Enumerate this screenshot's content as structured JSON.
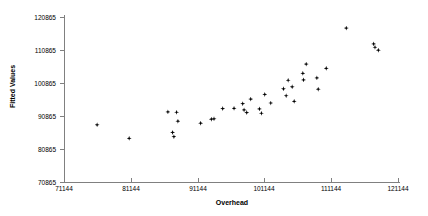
{
  "chart_data": {
    "type": "scatter",
    "title": "",
    "xlabel": "Overhead",
    "ylabel": "Fitted Values",
    "xlim": [
      71144,
      121144
    ],
    "ylim": [
      70865,
      120865
    ],
    "grid": false,
    "legend": null,
    "x_ticks": [
      71144,
      81144,
      91144,
      101144,
      111144,
      121144
    ],
    "y_ticks": [
      70865,
      80865,
      90865,
      100865,
      110865,
      120865
    ],
    "x_tick_labels": [
      "71144",
      "81144",
      "91144",
      "101144",
      "111144",
      "121144"
    ],
    "y_tick_labels": [
      "70865",
      "80865",
      "90865",
      "100865",
      "110865",
      "120865"
    ],
    "series": [
      {
        "name": "Fitted Values vs Overhead",
        "marker": "diamond",
        "color": "#000000",
        "points": [
          [
            76100,
            88200
          ],
          [
            80900,
            84100
          ],
          [
            86700,
            92100
          ],
          [
            87400,
            85900
          ],
          [
            87600,
            84600
          ],
          [
            88000,
            92000
          ],
          [
            88200,
            89300
          ],
          [
            91600,
            88700
          ],
          [
            93200,
            89900
          ],
          [
            93600,
            90000
          ],
          [
            94900,
            93100
          ],
          [
            96600,
            93200
          ],
          [
            97900,
            94600
          ],
          [
            98100,
            92700
          ],
          [
            98500,
            91900
          ],
          [
            99100,
            96000
          ],
          [
            100400,
            93000
          ],
          [
            100700,
            91700
          ],
          [
            101200,
            97400
          ],
          [
            102100,
            94800
          ],
          [
            104000,
            99100
          ],
          [
            104400,
            97000
          ],
          [
            104700,
            101700
          ],
          [
            105300,
            99700
          ],
          [
            105600,
            95300
          ],
          [
            106900,
            103800
          ],
          [
            107000,
            101800
          ],
          [
            107400,
            106600
          ],
          [
            109000,
            102400
          ],
          [
            109200,
            99000
          ],
          [
            110400,
            105300
          ],
          [
            113400,
            117500
          ],
          [
            117500,
            112700
          ],
          [
            117700,
            111700
          ],
          [
            118200,
            110800
          ]
        ]
      }
    ]
  }
}
